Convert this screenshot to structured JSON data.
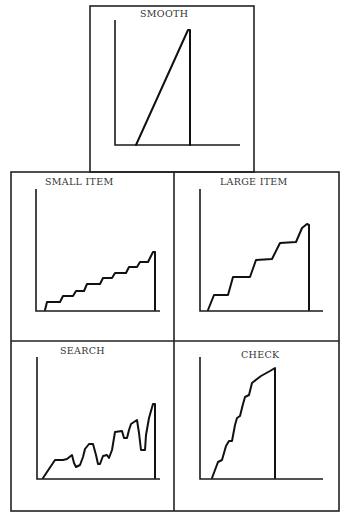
{
  "chart_data": [
    {
      "type": "line",
      "title": "SMOOTH",
      "xlabel": "",
      "ylabel": "",
      "grid": false,
      "description": "Single straight ramp rising from baseline then vertical drop",
      "points": [
        [
          136,
          145
        ],
        [
          188,
          30
        ],
        [
          190,
          30
        ],
        [
          190,
          145
        ]
      ]
    },
    {
      "type": "line",
      "title": "SMALL ITEM",
      "xlabel": "",
      "ylabel": "",
      "grid": false,
      "description": "Many small, short staircase steps rising gradually",
      "points": [
        [
          45,
          310
        ],
        [
          47,
          302
        ],
        [
          60,
          302
        ],
        [
          63,
          296
        ],
        [
          73,
          296
        ],
        [
          76,
          291
        ],
        [
          84,
          291
        ],
        [
          87,
          284
        ],
        [
          100,
          284
        ],
        [
          103,
          278
        ],
        [
          112,
          278
        ],
        [
          115,
          273
        ],
        [
          126,
          273
        ],
        [
          129,
          267
        ],
        [
          137,
          267
        ],
        [
          140,
          262
        ],
        [
          148,
          262
        ],
        [
          151,
          256
        ],
        [
          153,
          252
        ],
        [
          155,
          252
        ],
        [
          155,
          310
        ]
      ]
    },
    {
      "type": "line",
      "title": "LARGE ITEM",
      "xlabel": "",
      "ylabel": "",
      "grid": false,
      "description": "Fewer, larger staircase steps",
      "points": [
        [
          208,
          310
        ],
        [
          214,
          295
        ],
        [
          228,
          295
        ],
        [
          233,
          277
        ],
        [
          250,
          277
        ],
        [
          256,
          260
        ],
        [
          272,
          259
        ],
        [
          280,
          243
        ],
        [
          296,
          242
        ],
        [
          302,
          228
        ],
        [
          307,
          224
        ],
        [
          309,
          225
        ],
        [
          309,
          310
        ]
      ]
    },
    {
      "type": "line",
      "title": "SEARCH",
      "xlabel": "",
      "ylabel": "",
      "grid": false,
      "description": "Irregular rising curve with dips",
      "points": [
        [
          43,
          478
        ],
        [
          55,
          460
        ],
        [
          63,
          460
        ],
        [
          67,
          459
        ],
        [
          72,
          455
        ],
        [
          74,
          463
        ],
        [
          76,
          467
        ],
        [
          80,
          465
        ],
        [
          83,
          457
        ],
        [
          85,
          449
        ],
        [
          89,
          444
        ],
        [
          93,
          444
        ],
        [
          96,
          455
        ],
        [
          98,
          464
        ],
        [
          100,
          464
        ],
        [
          103,
          456
        ],
        [
          107,
          455
        ],
        [
          109,
          458
        ],
        [
          112,
          450
        ],
        [
          115,
          432
        ],
        [
          122,
          431
        ],
        [
          124,
          438
        ],
        [
          127,
          438
        ],
        [
          129,
          430
        ],
        [
          131,
          424
        ],
        [
          137,
          420
        ],
        [
          139,
          433
        ],
        [
          141,
          450
        ],
        [
          145,
          450
        ],
        [
          146,
          435
        ],
        [
          149,
          418
        ],
        [
          153,
          404
        ],
        [
          155,
          404
        ],
        [
          155,
          478
        ]
      ]
    },
    {
      "type": "line",
      "title": "CHECK",
      "xlabel": "",
      "ylabel": "",
      "grid": false,
      "description": "Steep wavy rise",
      "points": [
        [
          212,
          478
        ],
        [
          218,
          462
        ],
        [
          222,
          460
        ],
        [
          226,
          446
        ],
        [
          229,
          441
        ],
        [
          232,
          441
        ],
        [
          235,
          425
        ],
        [
          237,
          418
        ],
        [
          240,
          416
        ],
        [
          243,
          404
        ],
        [
          245,
          397
        ],
        [
          249,
          395
        ],
        [
          252,
          383
        ],
        [
          257,
          379
        ],
        [
          261,
          376
        ],
        [
          270,
          371
        ],
        [
          275,
          368
        ],
        [
          275,
          478
        ]
      ]
    }
  ],
  "panels": {
    "smooth": {
      "title": "SMOOTH"
    },
    "small_item": {
      "title": "SMALL ITEM"
    },
    "large_item": {
      "title": "LARGE ITEM"
    },
    "search": {
      "title": "SEARCH"
    },
    "check": {
      "title": "CHECK"
    }
  }
}
